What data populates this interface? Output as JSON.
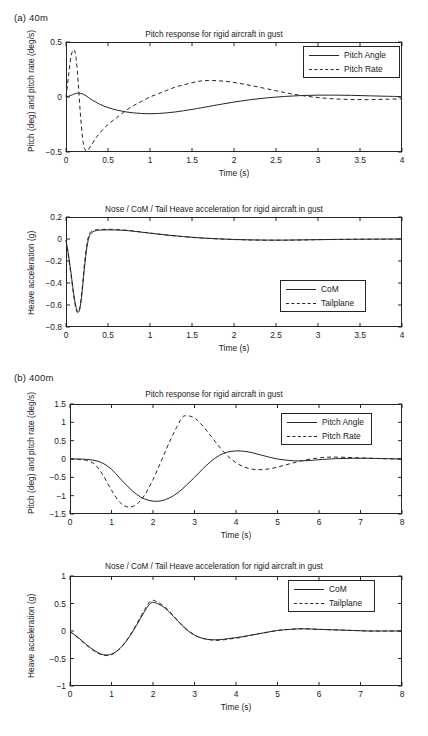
{
  "figure": {
    "panels": [
      {
        "key": "a",
        "label": "(a)  40m",
        "charts": [
          "a_pitch",
          "a_heave"
        ]
      },
      {
        "key": "b",
        "label": "(b)  400m",
        "charts": [
          "b_pitch",
          "b_heave"
        ]
      }
    ]
  },
  "chart_data": [
    {
      "id": "a_pitch",
      "type": "line",
      "title": "Pitch response for rigid aircraft in gust",
      "xlabel": "Time (s)",
      "ylabel": "Pitch (deg) and pitch rate (deg/s)",
      "xlim": [
        0,
        4
      ],
      "ylim": [
        -0.5,
        0.5
      ],
      "xticks": [
        0,
        0.5,
        1,
        1.5,
        2,
        2.5,
        3,
        3.5,
        4
      ],
      "xticklabels": [
        "0",
        "0.5",
        "1",
        "1.5",
        "2",
        "2.5",
        "3",
        "3.5",
        "4"
      ],
      "yticks": [
        -0.5,
        0,
        0.5
      ],
      "yticklabels": [
        "-0.5",
        "0",
        "0.5"
      ],
      "grid": false,
      "legend_position": "upper right",
      "series": [
        {
          "name": "Pitch Angle",
          "style": "solid",
          "x": [
            0,
            0.05,
            0.1,
            0.15,
            0.2,
            0.25,
            0.3,
            0.4,
            0.5,
            0.6,
            0.7,
            0.8,
            0.9,
            1.0,
            1.1,
            1.2,
            1.3,
            1.4,
            1.5,
            1.6,
            1.8,
            2.0,
            2.2,
            2.4,
            2.6,
            2.8,
            3.0,
            3.2,
            3.4,
            3.6,
            3.8,
            4.0
          ],
          "y": [
            0,
            0.012,
            0.028,
            0.035,
            0.027,
            0.005,
            -0.022,
            -0.065,
            -0.096,
            -0.118,
            -0.134,
            -0.144,
            -0.15,
            -0.152,
            -0.15,
            -0.144,
            -0.136,
            -0.125,
            -0.113,
            -0.1,
            -0.072,
            -0.046,
            -0.024,
            -0.007,
            0.005,
            0.013,
            0.017,
            0.017,
            0.015,
            0.011,
            0.007,
            0.004
          ]
        },
        {
          "name": "Pitch Rate",
          "style": "dashed",
          "x": [
            0,
            0.03,
            0.06,
            0.09,
            0.11,
            0.13,
            0.15,
            0.17,
            0.19,
            0.21,
            0.23,
            0.25,
            0.3,
            0.35,
            0.4,
            0.5,
            0.6,
            0.7,
            0.8,
            0.9,
            1.0,
            1.1,
            1.2,
            1.3,
            1.4,
            1.5,
            1.6,
            1.7,
            1.8,
            1.9,
            2.0,
            2.2,
            2.4,
            2.6,
            2.8,
            3.0,
            3.2,
            3.4,
            3.6,
            3.8,
            4.0
          ],
          "y": [
            0,
            0.19,
            0.37,
            0.43,
            0.4,
            0.28,
            0.08,
            -0.14,
            -0.32,
            -0.44,
            -0.48,
            -0.49,
            -0.44,
            -0.38,
            -0.33,
            -0.25,
            -0.19,
            -0.13,
            -0.08,
            -0.04,
            0.0,
            0.03,
            0.06,
            0.09,
            0.11,
            0.13,
            0.145,
            0.15,
            0.148,
            0.142,
            0.132,
            0.105,
            0.073,
            0.041,
            0.014,
            -0.005,
            -0.017,
            -0.023,
            -0.024,
            -0.021,
            -0.016
          ]
        }
      ]
    },
    {
      "id": "a_heave",
      "type": "line",
      "title": "Nose / CoM / Tail Heave acceleration for rigid aircraft in gust",
      "xlabel": "Time (s)",
      "ylabel": "Heave acceleration (g)",
      "xlim": [
        0,
        4
      ],
      "ylim": [
        -0.8,
        0.2
      ],
      "xticks": [
        0,
        0.5,
        1,
        1.5,
        2,
        2.5,
        3,
        3.5,
        4
      ],
      "xticklabels": [
        "0",
        "0.5",
        "1",
        "1.5",
        "2",
        "2.5",
        "3",
        "3.5",
        "4"
      ],
      "yticks": [
        -0.8,
        -0.6,
        -0.4,
        -0.2,
        0,
        0.2
      ],
      "yticklabels": [
        "-0.8",
        "-0.6",
        "-0.4",
        "-0.2",
        "0",
        "0.2"
      ],
      "grid": false,
      "legend_position": "lower right",
      "series": [
        {
          "name": "CoM",
          "style": "solid",
          "x": [
            0,
            0.02,
            0.04,
            0.06,
            0.08,
            0.1,
            0.12,
            0.14,
            0.16,
            0.18,
            0.2,
            0.22,
            0.25,
            0.28,
            0.32,
            0.36,
            0.4,
            0.5,
            0.6,
            0.7,
            0.8,
            1.0,
            1.2,
            1.4,
            1.6,
            1.8,
            2.0,
            2.2,
            2.4,
            2.6,
            2.8,
            3.0,
            3.2,
            3.5,
            4.0
          ],
          "y": [
            -0.01,
            -0.1,
            -0.2,
            -0.31,
            -0.43,
            -0.54,
            -0.62,
            -0.66,
            -0.65,
            -0.56,
            -0.42,
            -0.26,
            -0.07,
            0.03,
            0.065,
            0.076,
            0.08,
            0.083,
            0.082,
            0.078,
            0.071,
            0.053,
            0.036,
            0.022,
            0.01,
            0.002,
            -0.004,
            -0.008,
            -0.01,
            -0.01,
            -0.008,
            -0.006,
            -0.004,
            -0.002,
            0.0
          ]
        },
        {
          "name": "Tailplane",
          "style": "dashed",
          "x": [
            0,
            0.02,
            0.04,
            0.06,
            0.08,
            0.1,
            0.12,
            0.14,
            0.16,
            0.18,
            0.2,
            0.22,
            0.25,
            0.28,
            0.32,
            0.36,
            0.4,
            0.5,
            0.6,
            0.7,
            0.8,
            1.0,
            1.2,
            1.4,
            1.6,
            1.8,
            2.0,
            2.2,
            2.4,
            2.6,
            2.8,
            3.0,
            3.2,
            3.5,
            4.0
          ],
          "y": [
            -0.01,
            -0.11,
            -0.22,
            -0.33,
            -0.45,
            -0.56,
            -0.64,
            -0.67,
            -0.64,
            -0.54,
            -0.39,
            -0.22,
            -0.04,
            0.05,
            0.076,
            0.084,
            0.086,
            0.088,
            0.086,
            0.081,
            0.073,
            0.054,
            0.036,
            0.021,
            0.009,
            0.001,
            -0.005,
            -0.009,
            -0.011,
            -0.011,
            -0.009,
            -0.006,
            -0.004,
            -0.002,
            0.0
          ]
        }
      ]
    },
    {
      "id": "b_pitch",
      "type": "line",
      "title": "Pitch response for rigid aircraft in gust",
      "xlabel": "Time (s)",
      "ylabel": "Pitch (deg) and pitch rate (deg/s)",
      "xlim": [
        0,
        8
      ],
      "ylim": [
        -1.5,
        1.5
      ],
      "xticks": [
        0,
        1,
        2,
        3,
        4,
        5,
        6,
        7,
        8
      ],
      "xticklabels": [
        "0",
        "1",
        "2",
        "3",
        "4",
        "5",
        "6",
        "7",
        "8"
      ],
      "yticks": [
        -1.5,
        -1,
        -0.5,
        0,
        0.5,
        1,
        1.5
      ],
      "yticklabels": [
        "-1.5",
        "-1",
        "-0.5",
        "0",
        "0.5",
        "1",
        "1.5"
      ],
      "grid": false,
      "legend_position": "upper right",
      "series": [
        {
          "name": "Pitch Angle",
          "style": "solid",
          "x": [
            0,
            0.2,
            0.4,
            0.6,
            0.8,
            1.0,
            1.2,
            1.4,
            1.6,
            1.8,
            2.0,
            2.2,
            2.4,
            2.6,
            2.8,
            3.0,
            3.2,
            3.4,
            3.6,
            3.8,
            4.0,
            4.2,
            4.4,
            4.6,
            4.8,
            5.0,
            5.2,
            5.4,
            5.6,
            5.8,
            6.0,
            6.4,
            6.8,
            7.2,
            7.6,
            8.0
          ],
          "y": [
            0,
            0.0,
            -0.01,
            -0.04,
            -0.12,
            -0.28,
            -0.52,
            -0.76,
            -0.96,
            -1.09,
            -1.15,
            -1.14,
            -1.06,
            -0.92,
            -0.72,
            -0.5,
            -0.27,
            -0.06,
            0.1,
            0.19,
            0.22,
            0.21,
            0.17,
            0.11,
            0.05,
            0.0,
            -0.03,
            -0.05,
            -0.05,
            -0.04,
            -0.02,
            0.01,
            0.02,
            0.02,
            0.01,
            0.0
          ]
        },
        {
          "name": "Pitch Rate",
          "style": "dashed",
          "x": [
            0,
            0.2,
            0.4,
            0.6,
            0.8,
            1.0,
            1.2,
            1.4,
            1.6,
            1.8,
            2.0,
            2.2,
            2.4,
            2.6,
            2.7,
            2.8,
            3.0,
            3.2,
            3.4,
            3.6,
            3.8,
            4.0,
            4.2,
            4.4,
            4.6,
            4.8,
            5.0,
            5.2,
            5.4,
            5.6,
            5.8,
            6.0,
            6.2,
            6.5,
            7.0,
            7.5,
            8.0
          ],
          "y": [
            0,
            -0.01,
            -0.04,
            -0.15,
            -0.45,
            -0.85,
            -1.18,
            -1.31,
            -1.24,
            -0.98,
            -0.56,
            -0.05,
            0.47,
            0.93,
            1.13,
            1.18,
            1.12,
            0.9,
            0.62,
            0.33,
            0.08,
            -0.1,
            -0.22,
            -0.28,
            -0.29,
            -0.27,
            -0.22,
            -0.16,
            -0.1,
            -0.04,
            0.0,
            0.03,
            0.05,
            0.05,
            0.03,
            0.01,
            0.0
          ]
        }
      ]
    },
    {
      "id": "b_heave",
      "type": "line",
      "title": "Nose / CoM / Tail Heave acceleration for rigid aircraft in gust",
      "xlabel": "Time (s)",
      "ylabel": "Heave acceleration (g)",
      "xlim": [
        0,
        8
      ],
      "ylim": [
        -1,
        1
      ],
      "xticks": [
        0,
        1,
        2,
        3,
        4,
        5,
        6,
        7,
        8
      ],
      "xticklabels": [
        "0",
        "1",
        "2",
        "3",
        "4",
        "5",
        "6",
        "7",
        "8"
      ],
      "yticks": [
        -1,
        -0.5,
        0,
        0.5,
        1
      ],
      "yticklabels": [
        "-1",
        "-0.5",
        "0",
        "0.5",
        "1"
      ],
      "grid": false,
      "legend_position": "upper right",
      "series": [
        {
          "name": "CoM",
          "style": "solid",
          "x": [
            0,
            0.2,
            0.4,
            0.6,
            0.8,
            1.0,
            1.2,
            1.4,
            1.6,
            1.8,
            1.95,
            2.1,
            2.3,
            2.5,
            2.7,
            2.9,
            3.1,
            3.3,
            3.5,
            3.7,
            3.9,
            4.1,
            4.4,
            4.7,
            5.0,
            5.3,
            5.6,
            6.0,
            6.4,
            6.8,
            7.2,
            7.6,
            8.0
          ],
          "y": [
            -0.01,
            -0.12,
            -0.25,
            -0.36,
            -0.43,
            -0.42,
            -0.32,
            -0.14,
            0.1,
            0.36,
            0.51,
            0.5,
            0.41,
            0.26,
            0.1,
            -0.03,
            -0.11,
            -0.15,
            -0.16,
            -0.15,
            -0.13,
            -0.11,
            -0.07,
            -0.03,
            0.01,
            0.03,
            0.04,
            0.03,
            0.02,
            0.01,
            0.0,
            0.0,
            0.0
          ]
        },
        {
          "name": "Tailplane",
          "style": "dashed",
          "x": [
            0,
            0.2,
            0.4,
            0.6,
            0.8,
            1.0,
            1.2,
            1.4,
            1.6,
            1.8,
            1.95,
            2.1,
            2.3,
            2.5,
            2.7,
            2.9,
            3.1,
            3.3,
            3.5,
            3.7,
            3.9,
            4.1,
            4.4,
            4.7,
            5.0,
            5.3,
            5.6,
            6.0,
            6.4,
            6.8,
            7.2,
            7.6,
            8.0
          ],
          "y": [
            -0.01,
            -0.13,
            -0.26,
            -0.37,
            -0.44,
            -0.43,
            -0.32,
            -0.13,
            0.12,
            0.39,
            0.55,
            0.53,
            0.43,
            0.27,
            0.11,
            -0.02,
            -0.11,
            -0.15,
            -0.17,
            -0.16,
            -0.14,
            -0.12,
            -0.07,
            -0.03,
            0.01,
            0.03,
            0.04,
            0.03,
            0.02,
            0.01,
            0.0,
            0.0,
            0.0
          ]
        }
      ]
    }
  ],
  "legends": {
    "pitch": [
      {
        "label": "Pitch Angle",
        "style": "solid"
      },
      {
        "label": "Pitch Rate",
        "style": "dashed"
      }
    ],
    "heave": [
      {
        "label": "CoM",
        "style": "solid"
      },
      {
        "label": "Tailplane",
        "style": "dashed"
      }
    ]
  }
}
